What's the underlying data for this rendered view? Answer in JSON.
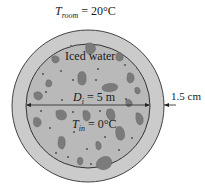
{
  "labels": {
    "room_temp": {
      "symbol": "T",
      "sub": "room",
      "value": " = 20°C"
    },
    "medium": "Iced water",
    "diameter": {
      "symbol": "D",
      "sub": "i",
      "value": " = 5 m"
    },
    "inner_temp": {
      "symbol": "T",
      "sub": "in",
      "value": " = 0°C"
    },
    "thickness": "1.5 cm"
  },
  "colors": {
    "insulation": "#c9c9c9",
    "interior": "#b8b8b8",
    "ice": "#7a7a7a",
    "line": "#3a3a3a"
  }
}
